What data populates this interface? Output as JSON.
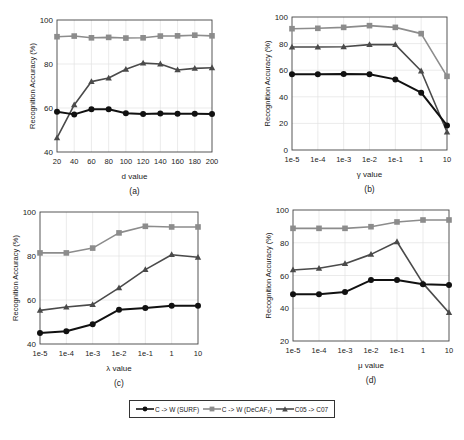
{
  "figure": {
    "legend": [
      {
        "label": "C -> W (SURF)",
        "color": "#111111",
        "marker": "circle"
      },
      {
        "label": "C -> W (DeCAF₇)",
        "color": "#8c8c8c",
        "marker": "square"
      },
      {
        "label": "C05 -> C07",
        "color": "#4a4a4a",
        "marker": "triangle"
      }
    ]
  },
  "chart_data": [
    {
      "id": "a",
      "type": "line",
      "caption": "(a)",
      "xlabel": "d value",
      "ylabel": "Recognition Accuracy (%)",
      "categories": [
        "20",
        "40",
        "60",
        "80",
        "100",
        "120",
        "140",
        "160",
        "180",
        "200"
      ],
      "ylim": [
        40,
        100
      ],
      "yticks": [
        40,
        60,
        80,
        100
      ],
      "grid": true,
      "series": [
        {
          "name": "C -> W (SURF)",
          "values": [
            58.3,
            57.1,
            59.4,
            59.4,
            57.6,
            57.3,
            57.5,
            57.4,
            57.4,
            57.3
          ]
        },
        {
          "name": "C -> W (DeCAF₇)",
          "values": [
            92.4,
            92.7,
            91.9,
            92.1,
            91.8,
            91.9,
            92.7,
            92.8,
            93.1,
            92.8
          ]
        },
        {
          "name": "C05 -> C07",
          "values": [
            46.4,
            61.4,
            72.0,
            73.6,
            77.6,
            80.4,
            80.0,
            77.3,
            78.0,
            78.3
          ]
        }
      ]
    },
    {
      "id": "b",
      "type": "line",
      "caption": "(b)",
      "xlabel": "γ value",
      "ylabel": "Recognition Accuracy (%)",
      "categories": [
        "1e-5",
        "1e-4",
        "1e-3",
        "1e-2",
        "1e-1",
        "1",
        "10"
      ],
      "ylim": [
        0,
        100
      ],
      "yticks": [
        0,
        20,
        40,
        60,
        80,
        100
      ],
      "grid": true,
      "series": [
        {
          "name": "C -> W (SURF)",
          "values": [
            56.9,
            56.9,
            57.2,
            56.9,
            53.1,
            43.1,
            18.5
          ]
        },
        {
          "name": "C -> W (DeCAF₇)",
          "values": [
            91.2,
            91.5,
            92.2,
            93.5,
            92.2,
            87.5,
            55.4
          ]
        },
        {
          "name": "C05 -> C07",
          "values": [
            77.4,
            77.4,
            77.6,
            79.2,
            79.2,
            59.4,
            13.5
          ]
        }
      ]
    },
    {
      "id": "c",
      "type": "line",
      "caption": "(c)",
      "xlabel": "λ value",
      "ylabel": "Recognition Accuracy (%)",
      "categories": [
        "1e-5",
        "1e-4",
        "1e-3",
        "1e-2",
        "1e-1",
        "1",
        "10"
      ],
      "ylim": [
        40,
        100
      ],
      "yticks": [
        40,
        60,
        80,
        100
      ],
      "grid": true,
      "series": [
        {
          "name": "C -> W (SURF)",
          "values": [
            45.0,
            45.8,
            49.0,
            55.6,
            56.4,
            57.4,
            57.4
          ]
        },
        {
          "name": "C -> W (DeCAF₇)",
          "values": [
            81.4,
            81.4,
            83.6,
            90.5,
            93.5,
            93.2,
            93.2
          ]
        },
        {
          "name": "C05 -> C07",
          "values": [
            55.3,
            56.8,
            57.9,
            65.5,
            73.8,
            80.6,
            79.4
          ]
        }
      ]
    },
    {
      "id": "d",
      "type": "line",
      "caption": "(d)",
      "xlabel": "μ value",
      "ylabel": "Recognition Accuracy (%)",
      "categories": [
        "1e-5",
        "1e-4",
        "1e-3",
        "1e-2",
        "1e-1",
        "1",
        "10"
      ],
      "ylim": [
        20,
        100
      ],
      "yticks": [
        20,
        40,
        60,
        80,
        100
      ],
      "grid": true,
      "series": [
        {
          "name": "C -> W (SURF)",
          "values": [
            48.5,
            48.5,
            49.9,
            57.2,
            57.2,
            54.6,
            54.2
          ]
        },
        {
          "name": "C -> W (DeCAF₇)",
          "values": [
            88.8,
            88.8,
            88.8,
            89.8,
            92.7,
            93.9,
            93.9
          ]
        },
        {
          "name": "C05 -> C07",
          "values": [
            63.4,
            64.4,
            67.2,
            72.9,
            80.6,
            55.2,
            37.3
          ]
        }
      ]
    }
  ]
}
